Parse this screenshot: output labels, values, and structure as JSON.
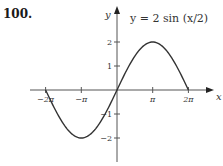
{
  "problem": {
    "number": "100."
  },
  "chart_data": {
    "type": "line",
    "title": "y = 2 sin (x/2)",
    "xlabel": "x",
    "ylabel": "y",
    "xlim": [
      -6.9,
      7.5
    ],
    "ylim": [
      -2.8,
      3.4
    ],
    "grid": false,
    "x_ticks": [
      {
        "value": -6.2832,
        "label": "−2π"
      },
      {
        "value": -3.1416,
        "label": "−π"
      },
      {
        "value": 3.1416,
        "label": "π"
      },
      {
        "value": 6.2832,
        "label": "2π"
      }
    ],
    "y_ticks": [
      {
        "value": 2,
        "label": "2"
      },
      {
        "value": 1,
        "label": "1"
      },
      {
        "value": -1,
        "label": "−1"
      },
      {
        "value": -2,
        "label": "−2"
      }
    ],
    "series": [
      {
        "name": "y = 2 sin (x/2)",
        "function": "2*sin(x/2)",
        "domain": [
          -6.2832,
          6.2832
        ],
        "x": [
          -6.2832,
          -4.7124,
          -3.1416,
          -1.5708,
          0,
          1.5708,
          3.1416,
          4.7124,
          6.2832
        ],
        "y": [
          0,
          -1.414,
          -2,
          -1.414,
          0,
          1.414,
          2,
          1.414,
          0
        ],
        "color": "#333333"
      }
    ]
  }
}
